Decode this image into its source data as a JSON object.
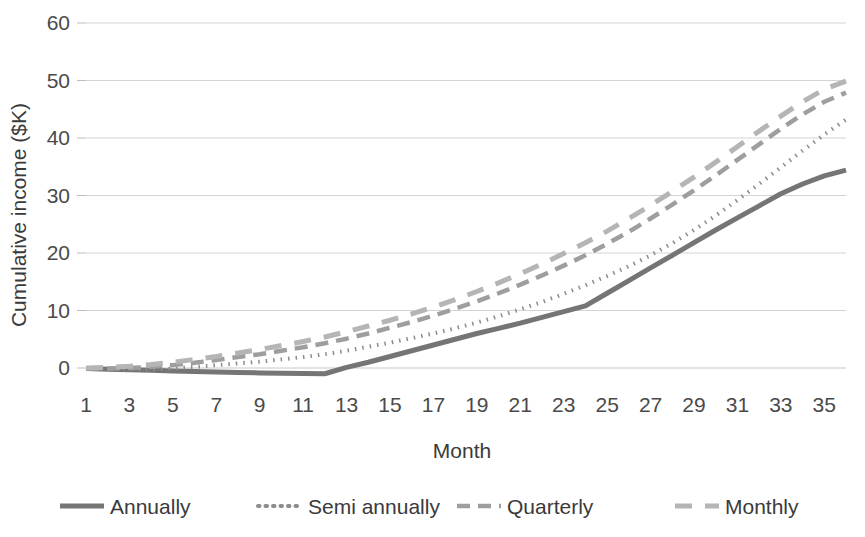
{
  "chart_data": {
    "type": "line",
    "title": "",
    "xlabel": "Month",
    "ylabel": "Cumulative income ($K)",
    "xlim": [
      1,
      36
    ],
    "ylim": [
      -2,
      60
    ],
    "yticks": [
      0,
      10,
      20,
      30,
      40,
      50,
      60
    ],
    "ytick_labels": [
      "0",
      "10",
      "20",
      "30",
      "40",
      "50",
      "60"
    ],
    "xticks": [
      1,
      3,
      5,
      7,
      9,
      11,
      13,
      15,
      17,
      19,
      21,
      23,
      25,
      27,
      29,
      31,
      33,
      35
    ],
    "xtick_labels": [
      "1",
      "3",
      "5",
      "7",
      "9",
      "11",
      "13",
      "15",
      "17",
      "19",
      "21",
      "23",
      "25",
      "27",
      "29",
      "31",
      "33",
      "35"
    ],
    "grid": true,
    "grid_axis": "y",
    "legend_position": "bottom",
    "x": [
      1,
      2,
      3,
      4,
      5,
      6,
      7,
      8,
      9,
      10,
      11,
      12,
      13,
      14,
      15,
      16,
      17,
      18,
      19,
      20,
      21,
      22,
      23,
      24,
      25,
      26,
      27,
      28,
      29,
      30,
      31,
      32,
      33,
      34,
      35,
      36
    ],
    "series": [
      {
        "name": "Annually",
        "style": "solid",
        "color": "#757575",
        "values": [
          -0.1,
          -0.2,
          -0.3,
          -0.4,
          -0.5,
          -0.6,
          -0.7,
          -0.8,
          -0.85,
          -0.9,
          -0.95,
          -1.0,
          0.1,
          1.0,
          2.0,
          3.0,
          4.0,
          5.0,
          6.0,
          6.9,
          7.8,
          8.8,
          9.8,
          10.8,
          13.0,
          15.2,
          17.4,
          19.6,
          21.8,
          24.0,
          26.1,
          28.2,
          30.3,
          32.0,
          33.4,
          34.4
        ]
      },
      {
        "name": "Semi annually",
        "style": "dotted",
        "color": "#8c8c8c",
        "values": [
          -0.1,
          -0.15,
          -0.2,
          -0.2,
          -0.1,
          0.2,
          0.5,
          0.8,
          1.1,
          1.5,
          1.9,
          2.4,
          3.0,
          3.7,
          4.4,
          5.2,
          6.0,
          6.9,
          7.9,
          9.0,
          10.2,
          11.5,
          12.9,
          14.4,
          16.0,
          17.7,
          19.6,
          21.7,
          24.0,
          26.5,
          29.2,
          32.0,
          34.9,
          37.8,
          40.6,
          43.2
        ]
      },
      {
        "name": "Quarterly",
        "style": "dashed",
        "color": "#9e9e9e",
        "values": [
          -0.1,
          -0.1,
          0.0,
          0.2,
          0.5,
          0.9,
          1.4,
          1.9,
          2.4,
          3.0,
          3.6,
          4.3,
          5.1,
          6.0,
          7.0,
          8.0,
          9.1,
          10.3,
          11.6,
          13.0,
          14.5,
          16.1,
          17.8,
          19.6,
          21.6,
          23.7,
          26.0,
          28.4,
          30.9,
          33.5,
          36.2,
          38.9,
          41.6,
          44.1,
          46.3,
          47.9
        ]
      },
      {
        "name": "Monthly",
        "style": "longdash",
        "color": "#b5b5b5",
        "values": [
          0.0,
          0.1,
          0.3,
          0.6,
          1.0,
          1.5,
          2.0,
          2.6,
          3.2,
          3.9,
          4.6,
          5.4,
          6.3,
          7.3,
          8.3,
          9.4,
          10.6,
          11.9,
          13.3,
          14.8,
          16.4,
          18.1,
          19.9,
          21.8,
          23.8,
          26.0,
          28.3,
          30.7,
          33.2,
          35.8,
          38.5,
          41.2,
          43.8,
          46.3,
          48.5,
          49.9
        ]
      }
    ]
  },
  "legend": {
    "items": [
      {
        "label": "Annually"
      },
      {
        "label": "Semi annually"
      },
      {
        "label": "Quarterly"
      },
      {
        "label": "Monthly"
      }
    ]
  }
}
